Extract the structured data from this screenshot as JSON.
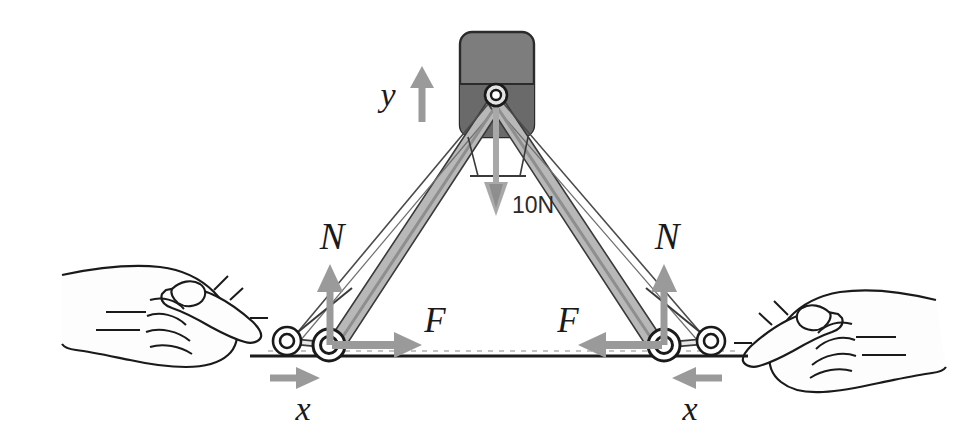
{
  "figure": {
    "background_color": "#ffffff",
    "ink_color": "#1a1a1a",
    "arrow_color": "#9a9a9a",
    "arrow_color_dark": "#8c8c8c",
    "leg_fill": "#b8b8b8",
    "leg_fill_dark": "#a2a2a2",
    "block_fill_top": "#7d7d7d",
    "block_fill_bottom": "#6a6a6a",
    "ground_color": "#1c1c1c",
    "skin_fill": "#fdfdfd",
    "shadow_fill": "#b9b9b9"
  },
  "labels": {
    "axis_y": "y",
    "axis_x_left": "x",
    "axis_x_right": "x",
    "normal_left": "N",
    "normal_right": "N",
    "friction_left": "F",
    "friction_right": "F",
    "weight": "10N"
  },
  "icons": {
    "y_axis_arrow": "arrow-up-icon",
    "weight_arrow": "arrow-down-icon",
    "normal_arrow_left": "arrow-up-icon",
    "normal_arrow_right": "arrow-up-icon",
    "friction_arrow_left": "arrow-right-icon",
    "friction_arrow_right": "arrow-left-icon",
    "x_arrow_left": "arrow-right-icon",
    "x_arrow_right": "arrow-left-icon",
    "hand_left": "hand-pointing-right-icon",
    "hand_right": "hand-pointing-left-icon",
    "pivot_top": "pivot-joint-icon",
    "roller_inner_left": "roller-wheel-icon",
    "roller_outer_left": "roller-wheel-icon",
    "roller_inner_right": "roller-wheel-icon",
    "roller_outer_right": "roller-wheel-icon",
    "block": "weight-block-icon",
    "ground": "ground-line-icon"
  },
  "geometry": {
    "apex": {
      "x": 496,
      "y": 95
    },
    "roller_inner_left": {
      "x": 329,
      "y": 345
    },
    "roller_outer_left": {
      "x": 287,
      "y": 341
    },
    "roller_inner_right": {
      "x": 664,
      "y": 345
    },
    "roller_outer_right": {
      "x": 711,
      "y": 341
    },
    "ground_y": 356,
    "ground_x_start": 250,
    "ground_x_end": 748
  }
}
